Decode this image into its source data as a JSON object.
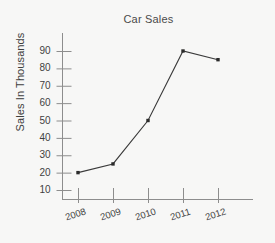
{
  "chart_data": {
    "type": "line",
    "title": "Car Sales",
    "xlabel": "",
    "ylabel": "Sales In Thousands",
    "categories": [
      "2008",
      "2009",
      "2010",
      "2011",
      "2012"
    ],
    "values": [
      20,
      25,
      50,
      90,
      85
    ],
    "series": [
      {
        "name": "Car Sales",
        "values": [
          20,
          25,
          50,
          90,
          85
        ]
      }
    ],
    "y_ticks": [
      10,
      20,
      30,
      40,
      50,
      60,
      70,
      80,
      90
    ],
    "ylim": [
      0,
      95
    ],
    "grid": false,
    "legend": "none",
    "marker": "square",
    "line_color": "#3a3a3a",
    "marker_color": "#2b2b2b",
    "axis_color": "#8d8d8d",
    "text_color": "#3f3f3f",
    "background_color": "#f7f7f6"
  }
}
